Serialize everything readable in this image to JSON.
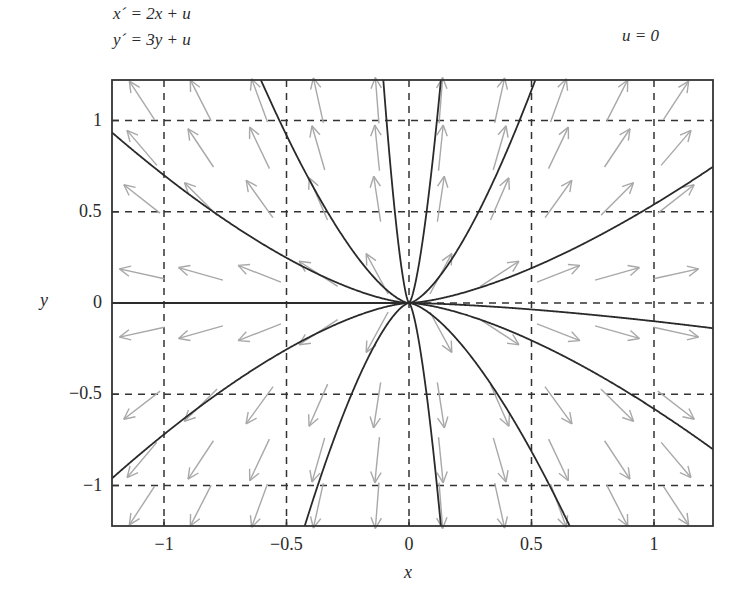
{
  "chart_data": {
    "type": "quiver+line",
    "title": "",
    "equations": [
      "x´ = 2x + u",
      "y´ = 3y + u"
    ],
    "annotation": "u = 0",
    "xlabel": "x",
    "ylabel": "y",
    "xlim": [
      -1.22,
      1.23
    ],
    "ylim": [
      -1.23,
      1.22
    ],
    "xticks": [
      -1,
      -0.5,
      0,
      0.5,
      1
    ],
    "xtick_labels": [
      "−1",
      "−0.5",
      "0",
      "0.5",
      "1"
    ],
    "yticks": [
      1,
      0.5,
      0,
      -0.5,
      -1
    ],
    "ytick_labels": [
      "1",
      "0.5",
      "0",
      "−0.5",
      "−1"
    ],
    "grid": "dashed",
    "vector_field": {
      "dx": "2x",
      "dy": "3y",
      "columns_x": [
        -1.09,
        -0.85,
        -0.61,
        -0.37,
        -0.13,
        0.13,
        0.37,
        0.61,
        0.85,
        1.09
      ],
      "rows_y": [
        1.11,
        0.85,
        0.57,
        0.16,
        -0.16,
        -0.56,
        -0.86,
        -1.11
      ],
      "color": "#a8a8a8"
    },
    "trajectories": {
      "form": "y = k * sign(x) * |x|^1.5",
      "color": "#2a2a2a",
      "series": [
        {
          "name": "traj-1",
          "k": 0.7,
          "side": "left",
          "upper": true
        },
        {
          "name": "traj-2",
          "k": 2.6,
          "side": "left",
          "upper": true
        },
        {
          "name": "traj-3",
          "k": 36.0,
          "side": "left",
          "upper": true
        },
        {
          "name": "traj-4",
          "k": 26.0,
          "side": "right",
          "upper": true
        },
        {
          "name": "traj-5",
          "k": 3.3,
          "side": "right",
          "upper": true
        },
        {
          "name": "traj-6",
          "k": 0.54,
          "side": "right",
          "upper": true
        },
        {
          "name": "traj-7",
          "k": 0.72,
          "side": "left",
          "upper": false
        },
        {
          "name": "traj-8",
          "k": 4.4,
          "side": "left",
          "upper": false
        },
        {
          "name": "traj-9",
          "k": 26.0,
          "side": "right",
          "upper": false
        },
        {
          "name": "traj-10",
          "k": 2.3,
          "side": "right",
          "upper": false
        },
        {
          "name": "traj-11",
          "k": 0.58,
          "side": "right",
          "upper": false
        },
        {
          "name": "traj-12",
          "k": 0.1,
          "side": "right",
          "upper": false
        },
        {
          "name": "traj-axis",
          "k": 0.0,
          "side": "left",
          "upper": true
        }
      ]
    }
  },
  "labels": {
    "eq1": "x´ = 2x + u",
    "eq2": "y´ = 3y + u",
    "u_value": "u = 0",
    "xlabel": "x",
    "ylabel": "y"
  }
}
